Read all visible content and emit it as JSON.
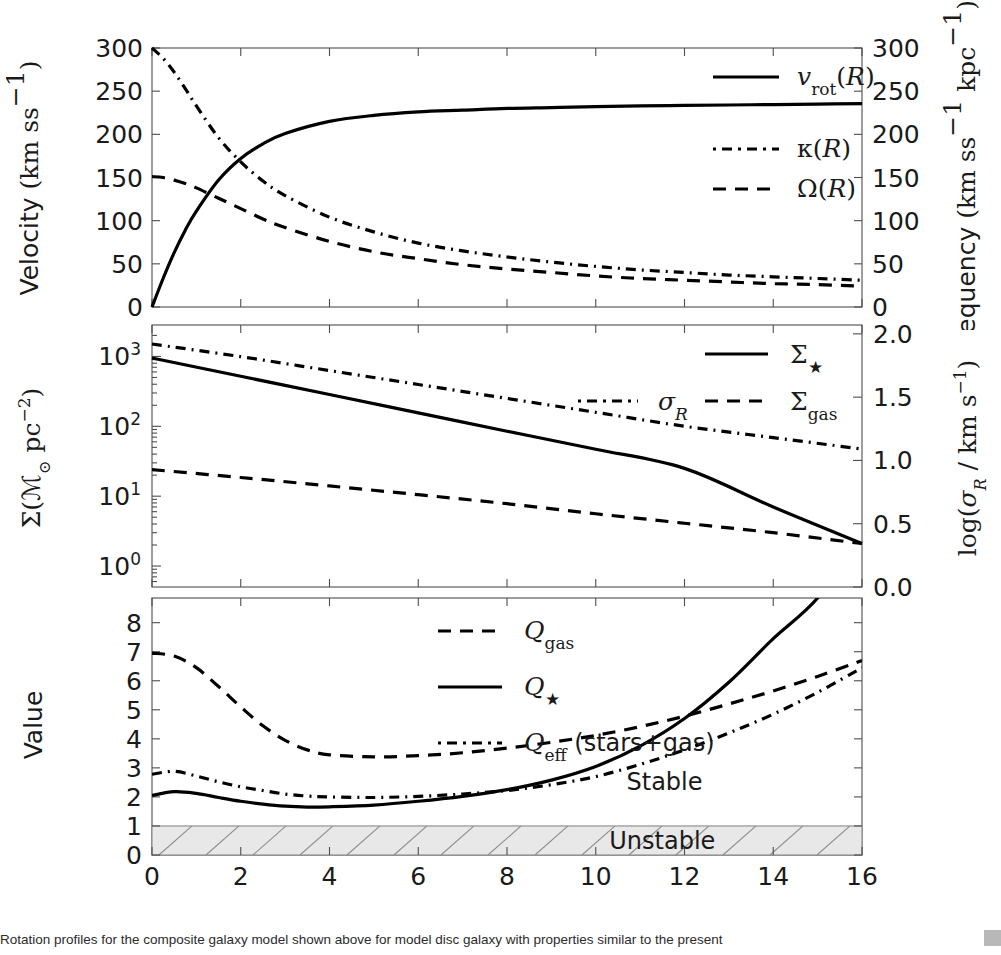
{
  "figure": {
    "xlabel": "Radius",
    "xunit": "(kpc)",
    "xticks": [
      0,
      2,
      4,
      6,
      8,
      10,
      12,
      14,
      16
    ],
    "xlim": [
      0,
      16
    ]
  },
  "panel_top": {
    "ylabel_left_main": "Velocity",
    "ylabel_left_unit": "(km s",
    "ylabel_left_exp": "−1",
    "ylabel_right_main": "Frequency",
    "ylabel_right_unit": "(km s",
    "ylabel_right_unit2": " kpc",
    "yticks_left": [
      0,
      50,
      100,
      150,
      200,
      250,
      300
    ],
    "yticks_right": [
      0,
      50,
      100,
      150,
      200,
      250,
      300
    ],
    "ylim_left": [
      0,
      300
    ],
    "ylim_right": [
      0,
      300
    ],
    "legend": [
      {
        "label": "v_rot(R)",
        "style": "solid"
      },
      {
        "label": "κ(R)",
        "style": "dashdot"
      },
      {
        "label": "Ω(R)",
        "style": "dash"
      }
    ]
  },
  "panel_mid": {
    "ylabel_left": "Σ(ℳ⊙ pc⁻²)",
    "ylabel_right": "log(σ_R / km s⁻¹)",
    "yticks_left_log": [
      0,
      1,
      2,
      3
    ],
    "yticks_right": [
      0.0,
      0.5,
      1.0,
      1.5,
      2.0
    ],
    "ylim_left_log": [
      -0.3,
      3.45
    ],
    "ylim_right": [
      0.0,
      2.07
    ],
    "legend": [
      {
        "label": "Σ★",
        "style": "solid"
      },
      {
        "label": "σ_R",
        "style": "dashdot"
      },
      {
        "label": "Σ_gas",
        "style": "dash"
      }
    ]
  },
  "panel_bot": {
    "ylabel": "Value",
    "yticks": [
      0,
      1,
      2,
      3,
      4,
      5,
      6,
      7,
      8
    ],
    "ylim": [
      0,
      8.85
    ],
    "legend": [
      {
        "label": "Q_gas",
        "style": "dash"
      },
      {
        "label": "Q★",
        "style": "solid"
      },
      {
        "label": "Q_eff (stars+gas)",
        "style": "dashdot"
      }
    ],
    "annotations": [
      {
        "text": "Stable",
        "x": 11.55,
        "y": 2.55
      },
      {
        "text": "Unstable",
        "x": 11.5,
        "y": 0.5
      }
    ],
    "unstable_band": {
      "from": 0,
      "to": 1,
      "fill": "#e8e8e8",
      "hatch": "#8a8a8a"
    }
  },
  "caption": {
    "line": "     Rotation profiles for the composite galaxy model shown above for model disc galaxy with properties similar to the present"
  },
  "chart_data": [
    {
      "type": "line",
      "panel": "top",
      "title": "",
      "xlabel": "Radius (kpc)",
      "ylabel": "Velocity (km s^-1)",
      "ylabel_right": "Frequency (km s^-1 kpc^-1)",
      "xlim": [
        0,
        16
      ],
      "ylim": [
        0,
        300
      ],
      "grid": false,
      "legend_position": "upper right",
      "x": [
        0,
        0.25,
        0.5,
        0.75,
        1,
        1.5,
        2,
        2.5,
        3,
        4,
        5,
        6,
        7,
        8,
        9,
        10,
        11,
        12,
        13,
        14,
        15,
        16
      ],
      "series": [
        {
          "name": "v_rot(R)",
          "style": "solid",
          "values": [
            0,
            33,
            63,
            89,
            111,
            147,
            172,
            189,
            201,
            215,
            222,
            226,
            228,
            230,
            231,
            232,
            233,
            233.5,
            234,
            234.5,
            235,
            235.5
          ]
        },
        {
          "name": "κ(R)",
          "style": "dashdot",
          "values": [
            300,
            288,
            272,
            253,
            233,
            196,
            168,
            146,
            129,
            104,
            87,
            74,
            65,
            58,
            52,
            47,
            43,
            40,
            37,
            35,
            33,
            31
          ]
        },
        {
          "name": "Ω(R)",
          "style": "dash",
          "values": [
            151,
            150,
            147,
            143,
            138,
            126,
            114,
            102,
            92,
            76,
            64,
            56,
            49,
            44,
            40,
            36,
            33,
            31,
            29,
            27,
            26,
            24
          ]
        }
      ]
    },
    {
      "type": "line",
      "panel": "middle",
      "xlabel": "Radius (kpc)",
      "ylabel": "Σ (M_sun pc^-2)",
      "ylabel_right": "log(σ_R / km s^-1)",
      "yscale": "log",
      "xlim": [
        0,
        16
      ],
      "ylim": [
        1,
        2818
      ],
      "grid": false,
      "legend_position": "upper right",
      "x": [
        0,
        2,
        4,
        6,
        8,
        10,
        12,
        14,
        16
      ],
      "series": [
        {
          "name": "Σ★",
          "style": "solid",
          "axis": "left",
          "values": [
            950,
            520,
            285,
            156,
            85,
            47,
            25,
            7.0,
            2.1
          ]
        },
        {
          "name": "Σ_gas",
          "style": "dash",
          "axis": "left",
          "values": [
            24,
            18.5,
            14,
            10.5,
            7.8,
            5.6,
            4.1,
            3.0,
            2.1
          ]
        },
        {
          "name": "σ_R",
          "style": "dashdot",
          "axis": "right",
          "values": [
            1.92,
            1.82,
            1.71,
            1.6,
            1.49,
            1.38,
            1.27,
            1.18,
            1.09
          ]
        }
      ]
    },
    {
      "type": "line",
      "panel": "bottom",
      "xlabel": "Radius (kpc)",
      "ylabel": "Value",
      "xlim": [
        0,
        16
      ],
      "ylim": [
        0,
        8.85
      ],
      "grid": false,
      "legend_position": "upper right",
      "x": [
        0,
        0.5,
        1,
        1.5,
        2,
        2.5,
        3,
        3.5,
        4,
        5,
        6,
        7,
        8,
        9,
        10,
        11,
        12,
        13,
        14,
        15,
        16
      ],
      "series": [
        {
          "name": "Q_gas",
          "style": "dash",
          "values": [
            6.95,
            6.85,
            6.45,
            5.8,
            5.1,
            4.45,
            3.95,
            3.62,
            3.45,
            3.38,
            3.42,
            3.52,
            3.68,
            3.88,
            4.12,
            4.42,
            4.78,
            5.2,
            5.65,
            6.15,
            6.7
          ]
        },
        {
          "name": "Q★",
          "style": "solid",
          "values": [
            2.05,
            2.18,
            2.12,
            1.98,
            1.85,
            1.75,
            1.68,
            1.65,
            1.66,
            1.72,
            1.85,
            2.02,
            2.25,
            2.58,
            3.05,
            3.75,
            4.7,
            5.95,
            7.45,
            8.85,
            11.0
          ]
        },
        {
          "name": "Q_eff (stars+gas)",
          "style": "dashdot",
          "values": [
            2.78,
            2.88,
            2.72,
            2.52,
            2.35,
            2.22,
            2.1,
            2.03,
            2.0,
            1.98,
            2.02,
            2.1,
            2.22,
            2.42,
            2.7,
            3.12,
            3.62,
            4.2,
            4.85,
            5.6,
            6.45
          ]
        }
      ],
      "annotations": [
        {
          "text": "Stable",
          "x": 11.55,
          "y": 2.55
        },
        {
          "text": "Unstable",
          "x": 11.5,
          "y": 0.5
        }
      ],
      "shaded_region": {
        "label": "Unstable",
        "ymin": 0,
        "ymax": 1
      }
    }
  ]
}
